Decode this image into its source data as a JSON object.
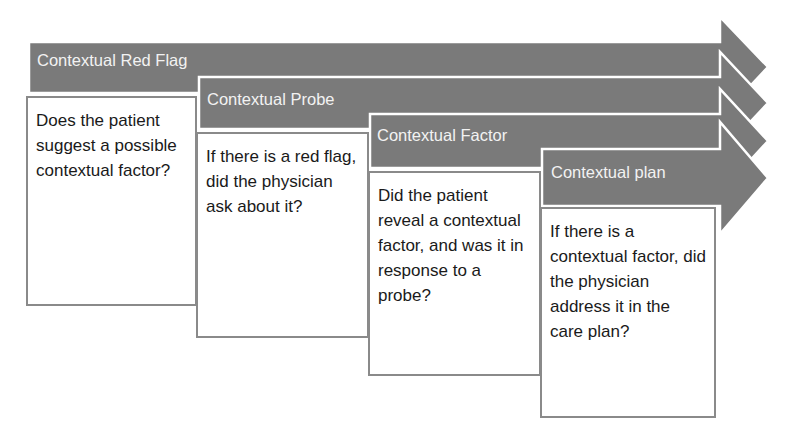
{
  "colors": {
    "arrow_fill": "#7a7a7a",
    "arrow_outline": "#ffffff",
    "card_border": "#8a8a8a",
    "label_text": "#f2f2f2",
    "card_text": "#1a1a1a"
  },
  "steps": [
    {
      "title": "Contextual Red Flag",
      "question": "Does the patient suggest a possible contextual factor?"
    },
    {
      "title": "Contextual Probe",
      "question": "If there is a red flag, did the physician ask about it?"
    },
    {
      "title": "Contextual Factor",
      "question": "Did the patient reveal a contextual factor, and was it in response to a probe?"
    },
    {
      "title": "Contextual plan",
      "question": "If there is a contextual factor, did the physician address it in the care plan?"
    }
  ]
}
